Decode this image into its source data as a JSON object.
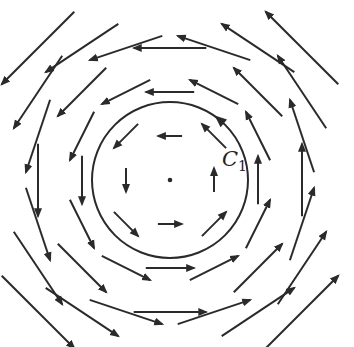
{
  "diagram": {
    "type": "vector-field",
    "field": "rotational (counterclockwise), v = (-y, x)",
    "grid": {
      "rows": 7,
      "cols": 7,
      "origin_px": [
        170,
        180
      ],
      "spacing_px": 44
    },
    "arrow_scale": 0.55,
    "center_point": true,
    "curve": {
      "name": "C",
      "subscript": "1",
      "radius_px": 78,
      "orientation": "counterclockwise"
    },
    "colors": {
      "stroke": "#2a2a2a",
      "background": "#ffffff"
    }
  }
}
